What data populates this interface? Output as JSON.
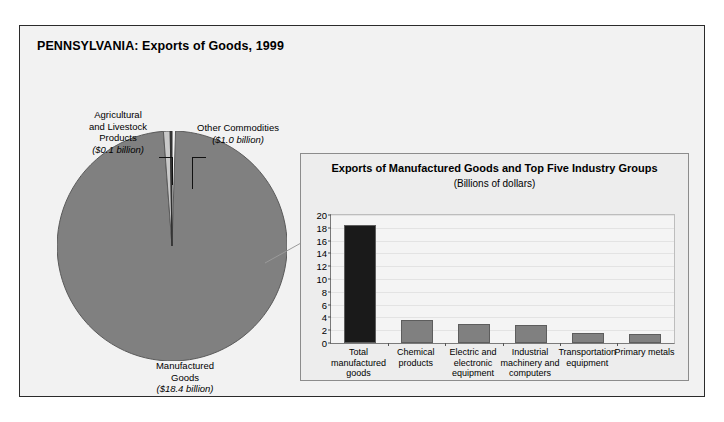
{
  "figure": {
    "title": "PENNSYLVANIA: Exports of Goods, 1999",
    "background_color": "#f2f2f2",
    "border_color": "#2b2b2b"
  },
  "pie_labels": {
    "agricultural": {
      "line1": "Agricultural",
      "line2": "and Livestock",
      "line3": "Products",
      "value": "($0.1 billion)"
    },
    "other": {
      "line1": "Other Commodities",
      "value": "($1.0 billion)"
    },
    "manufactured": {
      "line1": "Manufactured",
      "line2": "Goods",
      "value": "($18.4 billion)"
    }
  },
  "panel": {
    "title": "Exports of Manufactured Goods and Top Five Industry Groups",
    "subtitle": "(Billions of dollars)"
  },
  "chart_data": [
    {
      "type": "pie",
      "title": "PENNSYLVANIA: Exports of Goods, 1999",
      "unit": "Billions of dollars",
      "labels": [
        "Manufactured Goods",
        "Other Commodities",
        "Agricultural and Livestock Products"
      ],
      "values": [
        18.4,
        1.0,
        0.1
      ],
      "value_labels": [
        "($18.4 billion)",
        "($1.0 billion)",
        "($0.1 billion)"
      ],
      "colors": [
        "#808080",
        "#c9c9c9",
        "#3a3a3a"
      ],
      "total": 19.5,
      "legend": "none"
    },
    {
      "type": "bar",
      "title": "Exports of Manufactured Goods and Top Five Industry Groups",
      "subtitle": "(Billions of dollars)",
      "xlabel": "",
      "ylabel": "",
      "categories": [
        "Total manufactured goods",
        "Chemical products",
        "Electric and electronic equipment",
        "Industrial machinery and computers",
        "Transportation equipment",
        "Primary metals"
      ],
      "category_lines": [
        [
          "Total",
          "manufactured",
          "goods"
        ],
        [
          "Chemical",
          "products"
        ],
        [
          "Electric and",
          "electronic",
          "equipment"
        ],
        [
          "Industrial",
          "machinery and",
          "computers"
        ],
        [
          "Transportation",
          "equipment"
        ],
        [
          "Primary metals"
        ]
      ],
      "values": [
        18.4,
        3.6,
        2.9,
        2.8,
        1.5,
        1.4
      ],
      "bar_colors": [
        "#1a1a1a",
        "#808080",
        "#808080",
        "#808080",
        "#808080",
        "#808080"
      ],
      "ylim": [
        0,
        20
      ],
      "yticks": [
        0,
        2,
        4,
        6,
        8,
        10,
        12,
        14,
        16,
        18,
        20
      ],
      "ytick_labels": [
        "0",
        "2",
        "4",
        "6",
        "8",
        "10",
        "12",
        "14",
        "16",
        "18",
        "20"
      ],
      "grid": true,
      "legend": "none"
    }
  ]
}
